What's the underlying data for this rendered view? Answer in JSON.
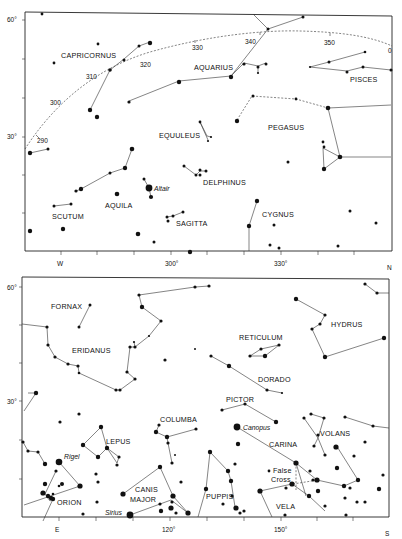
{
  "top_chart": {
    "name": "northern-sky-chart",
    "y_labels": [
      {
        "text": "60°",
        "y": 20
      },
      {
        "text": "30°",
        "y": 137
      }
    ],
    "x_labels": [
      {
        "text": "W",
        "x": 60
      },
      {
        "text": "300°",
        "x": 172
      },
      {
        "text": "330°",
        "x": 281
      },
      {
        "text": "N",
        "x": 390
      }
    ],
    "ecliptic_labels": [
      {
        "text": "290",
        "x": 37,
        "y": 142
      },
      {
        "text": "300",
        "x": 50,
        "y": 104
      },
      {
        "text": "310",
        "x": 86,
        "y": 78
      },
      {
        "text": "320",
        "x": 140,
        "y": 66
      },
      {
        "text": "330",
        "x": 192,
        "y": 50
      },
      {
        "text": "340",
        "x": 245,
        "y": 43
      },
      {
        "text": "350",
        "x": 324,
        "y": 45
      },
      {
        "text": "0",
        "x": 388,
        "y": 53
      }
    ],
    "constellations": [
      {
        "text": "CAPRICORNUS",
        "x": 61,
        "y": 58
      },
      {
        "text": "AQUARIUS",
        "x": 194,
        "y": 70
      },
      {
        "text": "PISCES",
        "x": 350,
        "y": 82
      },
      {
        "text": "EQUULEUS",
        "x": 159,
        "y": 138
      },
      {
        "text": "PEGASUS",
        "x": 268,
        "y": 130
      },
      {
        "text": "DELPHINUS",
        "x": 203,
        "y": 185
      },
      {
        "text": "AQUILA",
        "x": 105,
        "y": 208
      },
      {
        "text": "SCUTUM",
        "x": 52,
        "y": 219
      },
      {
        "text": "SAGITTA",
        "x": 176,
        "y": 226
      },
      {
        "text": "CYGNUS",
        "x": 262,
        "y": 217
      }
    ],
    "named_stars": [
      {
        "text": "Altair",
        "x": 153,
        "y": 191
      }
    ]
  },
  "bottom_chart": {
    "name": "southern-sky-chart",
    "y_labels": [
      {
        "text": "60°",
        "y": 289
      },
      {
        "text": "30°",
        "y": 403
      }
    ],
    "x_labels": [
      {
        "text": "E",
        "x": 58
      },
      {
        "text": "120°",
        "x": 169
      },
      {
        "text": "150°",
        "x": 281
      },
      {
        "text": "S",
        "x": 388
      }
    ],
    "constellations": [
      {
        "text": "FORNAX",
        "x": 51,
        "y": 309
      },
      {
        "text": "ERIDANUS",
        "x": 72,
        "y": 353
      },
      {
        "text": "RETICULUM",
        "x": 239,
        "y": 340
      },
      {
        "text": "HYDRUS",
        "x": 331,
        "y": 327
      },
      {
        "text": "DORADO",
        "x": 258,
        "y": 382
      },
      {
        "text": "PICTOR",
        "x": 226,
        "y": 402
      },
      {
        "text": "COLUMBA",
        "x": 160,
        "y": 422
      },
      {
        "text": "LEPUS",
        "x": 106,
        "y": 444
      },
      {
        "text": "CARINA",
        "x": 269,
        "y": 447
      },
      {
        "text": "VOLANS",
        "x": 320,
        "y": 436
      },
      {
        "text": "ORION",
        "x": 57,
        "y": 505
      },
      {
        "text": "CANIS",
        "x": 135,
        "y": 492
      },
      {
        "text": "MAJOR",
        "x": 130,
        "y": 502
      },
      {
        "text": "PUPPIS",
        "x": 207,
        "y": 499
      },
      {
        "text": "VELA",
        "x": 276,
        "y": 509
      },
      {
        "text": "False",
        "x": 273,
        "y": 473
      },
      {
        "text": "Cross",
        "x": 271,
        "y": 482
      }
    ],
    "named_stars": [
      {
        "text": "Rigel",
        "x": 64,
        "y": 459
      },
      {
        "text": "Canopus",
        "x": 243,
        "y": 430
      },
      {
        "text": "Sirius",
        "x": 105,
        "y": 515
      }
    ]
  }
}
